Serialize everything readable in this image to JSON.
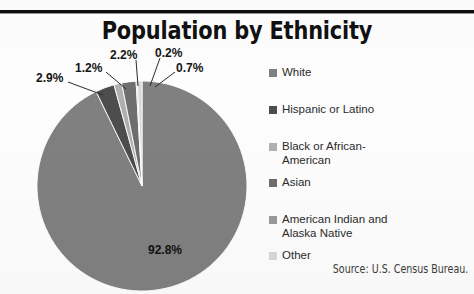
{
  "title": "Population by Ethnicity",
  "source_note": "Source: U.S. Census Bureau.",
  "colors": {
    "white_slice": "#808080",
    "hispanic_slice": "#4d4d4d",
    "black_slice": "#b0b0b0",
    "asian_slice": "#6e6e6e",
    "american_indian_slice": "#9a9a9a",
    "other_slice": "#d8d8d8",
    "title_text": "#111111",
    "rule": "#0d0d0d",
    "background": "#fdfdfd"
  },
  "callouts": {
    "hispanic": "2.9%",
    "black": "1.2%",
    "asian": "2.2%",
    "american_indian": "0.2%",
    "other": "0.7%",
    "white": "92.8%"
  },
  "legend": {
    "items": [
      {
        "label": "White",
        "color": "#808080",
        "value": 92.8
      },
      {
        "label": "Hispanic or Latino",
        "color": "#4d4d4d",
        "value": 2.9
      },
      {
        "label": "Black or African-\nAmerican",
        "color": "#b0b0b0",
        "value": 1.2
      },
      {
        "label": "Asian",
        "color": "#6e6e6e",
        "value": 2.2
      },
      {
        "label": "American Indian and\nAlaska Native",
        "color": "#9a9a9a",
        "value": 0.2
      },
      {
        "label": "Other",
        "color": "#d8d8d8",
        "value": 0.7
      }
    ]
  },
  "chart_data": {
    "type": "pie",
    "title": "Population by Ethnicity",
    "categories": [
      "White",
      "Hispanic or Latino",
      "Black or African-American",
      "Asian",
      "American Indian and Alaska Native",
      "Other"
    ],
    "values": [
      92.8,
      2.9,
      1.2,
      2.2,
      0.2,
      0.7
    ],
    "value_labels": [
      "92.8%",
      "2.9%",
      "1.2%",
      "2.2%",
      "0.2%",
      "0.7%"
    ],
    "colors": [
      "#808080",
      "#4d4d4d",
      "#b0b0b0",
      "#6e6e6e",
      "#9a9a9a",
      "#d8d8d8"
    ],
    "units": "percent",
    "total": 100.0,
    "start_angle_deg": 0,
    "direction": "clockwise",
    "legend_position": "right",
    "grid": false,
    "xlabel": "",
    "ylabel": "",
    "annotations": [
      "Source: U.S. Census Bureau."
    ]
  }
}
